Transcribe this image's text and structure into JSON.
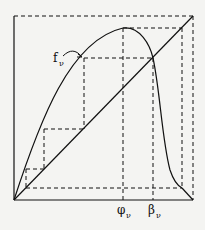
{
  "figure": {
    "type": "cobweb-diagram",
    "background": "#f4f4f2",
    "ink": "#111111",
    "labels": {
      "curve": "f",
      "curve_sub": "ν",
      "x_tick_1": "φ",
      "x_tick_1_sub": "ν",
      "x_tick_2": "β",
      "x_tick_2_sub": "ν"
    },
    "elements": [
      "outer dashed square",
      "solid axes",
      "diagonal y=x",
      "unimodal curve f_ν",
      "dashed cobweb iterations",
      "peak at φ_ν",
      "fixed point at β_ν"
    ]
  }
}
